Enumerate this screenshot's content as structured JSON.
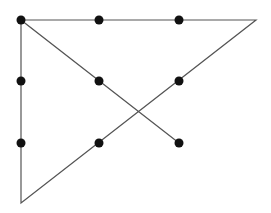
{
  "diagram": {
    "background": "#ffffff",
    "line_color": "#555555",
    "dot_color": "#111111",
    "dot_radius": 4.5,
    "dots": [
      {
        "x": 21,
        "y": 20
      },
      {
        "x": 99,
        "y": 20
      },
      {
        "x": 179,
        "y": 20
      },
      {
        "x": 21,
        "y": 81
      },
      {
        "x": 99,
        "y": 81
      },
      {
        "x": 179,
        "y": 81
      },
      {
        "x": 21,
        "y": 143
      },
      {
        "x": 99,
        "y": 143
      },
      {
        "x": 179,
        "y": 143
      }
    ],
    "path": [
      {
        "x": 179,
        "y": 143
      },
      {
        "x": 21,
        "y": 20
      },
      {
        "x": 256,
        "y": 20
      },
      {
        "x": 21,
        "y": 203
      },
      {
        "x": 21,
        "y": 20
      }
    ]
  }
}
